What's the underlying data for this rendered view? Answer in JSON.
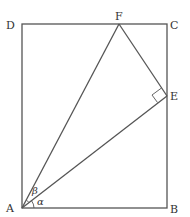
{
  "diagram": {
    "type": "geometry",
    "points": {
      "A": {
        "label": "A",
        "x": 22,
        "y": 208
      },
      "B": {
        "label": "B",
        "x": 167,
        "y": 208
      },
      "C": {
        "label": "C",
        "x": 167,
        "y": 24
      },
      "D": {
        "label": "D",
        "x": 22,
        "y": 24
      },
      "E": {
        "label": "E",
        "x": 167,
        "y": 96
      },
      "F": {
        "label": "F",
        "x": 119,
        "y": 24
      }
    },
    "angles": {
      "alpha": {
        "label": "α",
        "between": [
          "AB",
          "AE"
        ]
      },
      "beta": {
        "label": "β",
        "between": [
          "AE",
          "AF"
        ]
      }
    },
    "right_angle_at": "E",
    "segments": [
      "AB",
      "BC",
      "CD",
      "DA",
      "AF",
      "AE",
      "EF"
    ]
  }
}
